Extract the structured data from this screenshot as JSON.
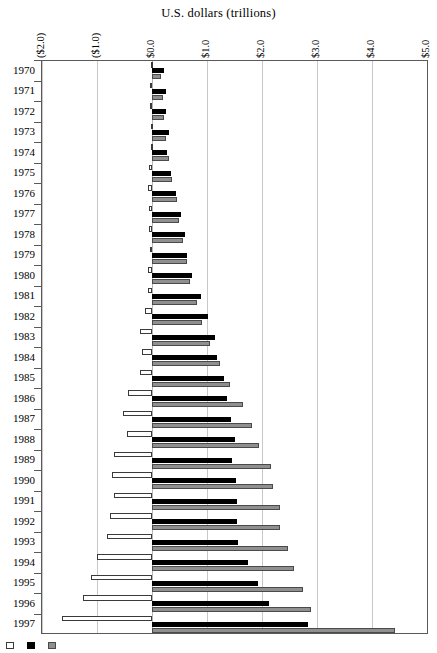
{
  "chart_data": {
    "type": "bar",
    "orientation": "horizontal",
    "title": "U.S. dollars (trillions)",
    "xlabel": "U.S. dollars (trillions)",
    "ylabel": "",
    "xlim": [
      -2.0,
      5.0
    ],
    "grid": true,
    "legend_position": "bottom-left",
    "xticks": [
      "($2.0)",
      "($1.0)",
      "$0.0",
      "$1.0",
      "$2.0",
      "$3.0",
      "$4.0",
      "$5.0"
    ],
    "xtick_values": [
      -2.0,
      -1.0,
      0.0,
      1.0,
      2.0,
      3.0,
      4.0,
      5.0
    ],
    "categories": [
      "1970",
      "1971",
      "1972",
      "1973",
      "1974",
      "1975",
      "1976",
      "1977",
      "1978",
      "1979",
      "1980",
      "1981",
      "1982",
      "1983",
      "1984",
      "1985",
      "1986",
      "1987",
      "1988",
      "1989",
      "1990",
      "1991",
      "1992",
      "1993",
      "1994",
      "1995",
      "1996",
      "1997"
    ],
    "series": [
      {
        "name": "series-white",
        "style": "white",
        "values": [
          -0.02,
          -0.03,
          -0.03,
          -0.02,
          -0.02,
          -0.06,
          -0.08,
          -0.06,
          -0.05,
          -0.04,
          -0.07,
          -0.08,
          -0.13,
          -0.21,
          -0.19,
          -0.22,
          -0.43,
          -0.53,
          -0.45,
          -0.7,
          -0.72,
          -0.69,
          -0.76,
          -0.82,
          -1.0,
          -1.11,
          -1.25,
          -1.63
        ]
      },
      {
        "name": "series-black",
        "style": "black",
        "values": [
          0.22,
          0.26,
          0.25,
          0.3,
          0.28,
          0.34,
          0.44,
          0.52,
          0.6,
          0.64,
          0.73,
          0.89,
          1.02,
          1.14,
          1.19,
          1.31,
          1.37,
          1.44,
          1.5,
          1.46,
          1.52,
          1.54,
          1.55,
          1.57,
          1.75,
          1.93,
          2.12,
          2.84
        ]
      },
      {
        "name": "series-gray",
        "style": "gray",
        "values": [
          0.16,
          0.2,
          0.22,
          0.26,
          0.3,
          0.37,
          0.45,
          0.49,
          0.56,
          0.63,
          0.69,
          0.81,
          0.91,
          1.06,
          1.24,
          1.42,
          1.65,
          1.82,
          1.95,
          2.16,
          2.2,
          2.32,
          2.32,
          2.48,
          2.59,
          2.74,
          2.89,
          4.41
        ]
      }
    ]
  },
  "legend": {
    "items": [
      {
        "style": "white",
        "label": ""
      },
      {
        "style": "black",
        "label": ""
      },
      {
        "style": "gray",
        "label": ""
      }
    ]
  }
}
